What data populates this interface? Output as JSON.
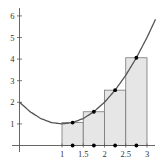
{
  "chart_data": {
    "type": "line",
    "title": "",
    "subtitle": "Midpoint Riemann sum of f(x) = (x-1)^2 + 1 on [1, 3] with 4 subintervals",
    "xlabel": "",
    "ylabel": "",
    "xlim": [
      0,
      3.3
    ],
    "ylim": [
      -0.3,
      6.3
    ],
    "grid": false,
    "legend": null,
    "x_ticks": [
      1,
      1.5,
      2,
      2.5,
      3
    ],
    "x_tick_labels": [
      "1",
      "1.5",
      "2",
      "2.5",
      "3"
    ],
    "y_ticks": [
      1,
      2,
      3,
      4,
      5,
      6
    ],
    "y_tick_labels": [
      "1",
      "2",
      "3",
      "4",
      "5",
      "6"
    ],
    "curve": {
      "name": "f(x)",
      "x": [
        0,
        0.25,
        0.5,
        0.75,
        1,
        1.25,
        1.5,
        1.75,
        2,
        2.25,
        2.5,
        2.75,
        3,
        3.2
      ],
      "y": [
        2,
        1.5625,
        1.25,
        1.0625,
        1,
        1.0625,
        1.25,
        1.5625,
        2,
        2.5625,
        3.25,
        4.0625,
        5,
        5.84
      ]
    },
    "rectangles": [
      {
        "x0": 1,
        "x1": 1.5,
        "height": 1.0625
      },
      {
        "x0": 1.5,
        "x1": 2,
        "height": 1.5625
      },
      {
        "x0": 2,
        "x1": 2.5,
        "height": 2.5625
      },
      {
        "x0": 2.5,
        "x1": 3,
        "height": 4.0625
      }
    ],
    "midpoints": {
      "x": [
        1.25,
        1.75,
        2.25,
        2.75
      ],
      "y": [
        1.0625,
        1.5625,
        2.5625,
        4.0625
      ]
    },
    "colors": {
      "curve": "#555555",
      "rect_fill": "#e6e6e6",
      "rect_stroke": "#777777",
      "axis": "#555555",
      "point": "#000000"
    }
  }
}
